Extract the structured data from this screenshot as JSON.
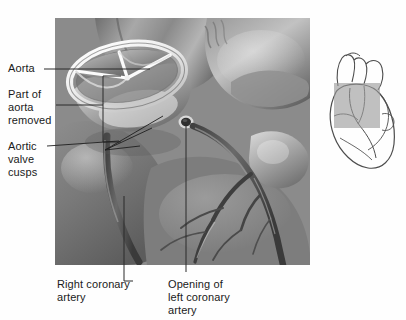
{
  "figure": {
    "type": "anatomical-illustration",
    "style": "grayscale airbrush medical illustration"
  },
  "labels": {
    "aorta": "Aorta",
    "part_of_aorta_removed": "Part of\naorta\nremoved",
    "aortic_valve_cusps": "Aortic\nvalve\ncusps",
    "right_coronary_artery": "Right coronary\nartery",
    "opening_left_coronary_artery": "Opening of\nleft coronary\nartery"
  },
  "structures": {
    "valve_ring": "aortic-valve-annulus",
    "cusps_count": 3,
    "cusp_names": [
      "right-coronary-cusp",
      "left-coronary-cusp",
      "non-coronary-cusp"
    ],
    "left_coronary_ostium": "opening-of-left-coronary-artery",
    "right_coronary_artery": "right-coronary-artery-vessel",
    "aorta_wall": "cut-edge-of-aorta"
  },
  "inset": {
    "name": "orientation-heart-diagram",
    "description": "line drawing of whole heart",
    "highlight": "gray rectangle marking magnified region"
  },
  "colors": {
    "background": "#fefefe",
    "text": "#1a1a1a",
    "leader": "#2a2a2a",
    "tissue_mid": "#8e8e8e",
    "tissue_dark": "#4a4a4a",
    "tissue_light": "#d8d8d8",
    "valve_rim": "#f2f2f2",
    "inset_outline": "#4d4d4d",
    "inset_highlight": "#9a9a9a"
  }
}
